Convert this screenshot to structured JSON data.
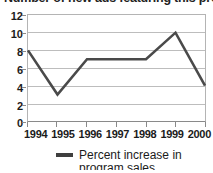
{
  "chart_data": {
    "type": "line",
    "title": "Number of new ads featuring this product",
    "title_cropped": true,
    "categories": [
      "1994",
      "1995",
      "1996",
      "1997",
      "1998",
      "1999",
      "2000"
    ],
    "values": [
      8,
      3,
      7,
      7,
      7,
      10,
      4
    ],
    "series": [
      {
        "name": "Percent increase in",
        "values": [
          8,
          3,
          7,
          7,
          7,
          10,
          4
        ]
      }
    ],
    "xlabel": "",
    "ylabel": "",
    "ylim": [
      0,
      12
    ],
    "yticks": [
      12,
      10,
      8,
      6,
      4,
      2,
      0
    ],
    "grid": true,
    "legend_position": "bottom",
    "legend": [
      {
        "label_line1": "Percent increase in",
        "label_line2": "program sales",
        "swatch_color": "#3f3f3f"
      }
    ],
    "line_color": "#4a4a4a",
    "gridline_color": "#bdbdbd",
    "axis_color": "#8a8a8a",
    "background_color": "#ffffff",
    "text_color": "#1b1b1b"
  }
}
